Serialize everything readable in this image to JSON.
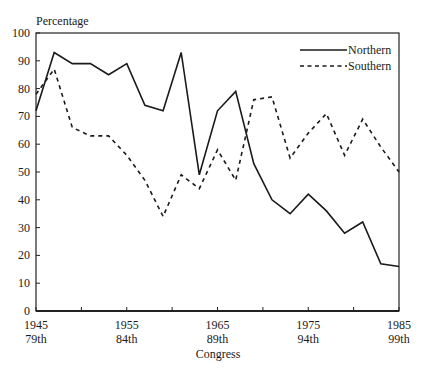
{
  "chart_data": {
    "type": "line",
    "title": "",
    "ylabel": "Percentage",
    "xlabel": "Congress",
    "ylim": [
      0,
      100
    ],
    "xlim": [
      1945,
      1985
    ],
    "yticks": [
      0,
      10,
      20,
      30,
      40,
      50,
      60,
      70,
      80,
      90,
      100
    ],
    "xticks": [
      1945,
      1950,
      1955,
      1960,
      1965,
      1970,
      1975,
      1980,
      1985
    ],
    "xtick_labels": [
      {
        "year": 1945,
        "line1": "1945",
        "line2": "79th"
      },
      {
        "year": 1955,
        "line1": "1955",
        "line2": "84th"
      },
      {
        "year": 1965,
        "line1": "1965",
        "line2": "89th"
      },
      {
        "year": 1975,
        "line1": "1975",
        "line2": "94th"
      },
      {
        "year": 1985,
        "line1": "1985",
        "line2": "99th"
      }
    ],
    "grid": false,
    "legend_position": "upper right",
    "x": [
      1945,
      1947,
      1949,
      1951,
      1953,
      1955,
      1957,
      1959,
      1961,
      1963,
      1965,
      1967,
      1969,
      1971,
      1973,
      1975,
      1977,
      1979,
      1981,
      1983,
      1985
    ],
    "series": [
      {
        "name": "Northern",
        "style": "solid",
        "values": [
          72,
          93,
          89,
          89,
          85,
          89,
          74,
          72,
          93,
          49,
          72,
          79,
          53,
          40,
          35,
          42,
          36,
          28,
          32,
          17,
          16
        ]
      },
      {
        "name": "Southern",
        "style": "dashed",
        "values": [
          78,
          87,
          66,
          63,
          63,
          56,
          47,
          34,
          49,
          44,
          58,
          47,
          76,
          77,
          55,
          64,
          71,
          56,
          69,
          59,
          50
        ]
      }
    ]
  },
  "legend": {
    "northern": "Northern",
    "southern": "Southern"
  },
  "axis": {
    "ylabel": "Percentage",
    "xlabel": "Congress"
  }
}
